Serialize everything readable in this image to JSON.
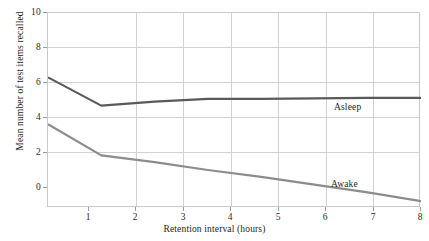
{
  "chart_data": {
    "type": "line",
    "title": "",
    "xlabel": "Retention interval (hours)",
    "ylabel": "Mean number of test items recalled",
    "xlim": [
      1,
      8
    ],
    "ylim": [
      0,
      10
    ],
    "xticks": [
      1,
      2,
      3,
      4,
      5,
      6,
      7,
      8
    ],
    "xtick_labels": [
      "1",
      "2",
      "3",
      "4",
      "5",
      "6",
      "7",
      "8"
    ],
    "yticks": [
      0,
      2,
      4,
      6,
      8,
      10
    ],
    "ytick_labels": [
      "0",
      "2",
      "4",
      "6",
      "8",
      "10"
    ],
    "grid": true,
    "legend_position": "inline-annotation",
    "x": [
      1,
      2,
      3,
      4,
      5,
      6,
      7,
      8
    ],
    "series": [
      {
        "name": "Asleep",
        "color": "#5a5a5a",
        "values": [
          6.7,
          5.25,
          5.45,
          5.6,
          5.6,
          5.62,
          5.65,
          5.65
        ]
      },
      {
        "name": "Awake",
        "color": "#8c8c8c",
        "values": [
          4.3,
          2.7,
          2.35,
          1.95,
          1.6,
          1.2,
          0.8,
          0.35
        ]
      }
    ],
    "annotations": [
      {
        "text": "Asleep",
        "x": 6.0,
        "y": 4.9
      },
      {
        "text": "Awake",
        "x": 5.95,
        "y": 0.55
      }
    ]
  },
  "colors": {
    "background": "#ffffff",
    "grid": "#d2d2d2",
    "axis": "#c9c9c9",
    "text": "#1e1e1e",
    "asleep": "#5a5a5a",
    "awake": "#8c8c8c"
  }
}
